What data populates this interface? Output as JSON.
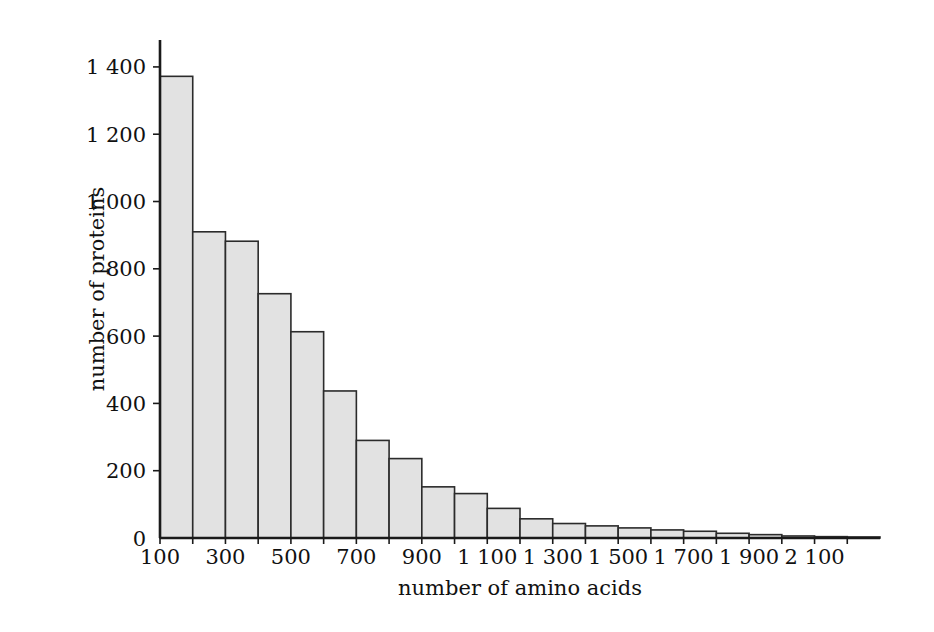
{
  "figure": {
    "background_color": "#ffffff",
    "bar_fill_color": "#e2e2e2",
    "bar_border_color": "#2b2b2b",
    "axis_color": "#1a1a1a"
  },
  "chart_data": {
    "type": "bar",
    "title": "",
    "subtitle": "",
    "xlabel": "number of amino acids",
    "ylabel": "number of proteins",
    "grid": false,
    "legend": false,
    "legend_position": "none",
    "bin_width": 100,
    "xlim": [
      100,
      2300
    ],
    "ylim": [
      0,
      1480
    ],
    "x_tick_values": [
      100,
      300,
      500,
      700,
      900,
      1100,
      1300,
      1500,
      1700,
      1900,
      2100
    ],
    "x_tick_labels": [
      "100",
      "300",
      "500",
      "700",
      "900",
      "1 100",
      "1 300",
      "1 500",
      "1 700",
      "1 900",
      "2 100"
    ],
    "x_minor_tick_values": [
      200,
      400,
      600,
      800,
      1000,
      1200,
      1400,
      1600,
      1800,
      2000,
      2200
    ],
    "y_tick_values": [
      0,
      200,
      400,
      600,
      800,
      1000,
      1200,
      1400
    ],
    "y_tick_labels": [
      "0",
      "200",
      "400",
      "600",
      "800",
      "1 000",
      "1 200",
      "1 400"
    ],
    "bin_starts": [
      100,
      200,
      300,
      400,
      500,
      600,
      700,
      800,
      900,
      1000,
      1100,
      1200,
      1300,
      1400,
      1500,
      1600,
      1700,
      1800,
      1900,
      2000,
      2100,
      2200
    ],
    "categories": [
      "100-200",
      "200-300",
      "300-400",
      "400-500",
      "500-600",
      "600-700",
      "700-800",
      "800-900",
      "900-1000",
      "1000-1100",
      "1100-1200",
      "1200-1300",
      "1300-1400",
      "1400-1500",
      "1500-1600",
      "1600-1700",
      "1700-1800",
      "1800-1900",
      "1900-2000",
      "2000-2100",
      "2100-2200",
      "2200-2300"
    ],
    "values": [
      1372,
      910,
      882,
      726,
      613,
      437,
      290,
      236,
      152,
      132,
      88,
      57,
      43,
      36,
      30,
      24,
      20,
      14,
      10,
      6,
      4,
      3
    ]
  }
}
